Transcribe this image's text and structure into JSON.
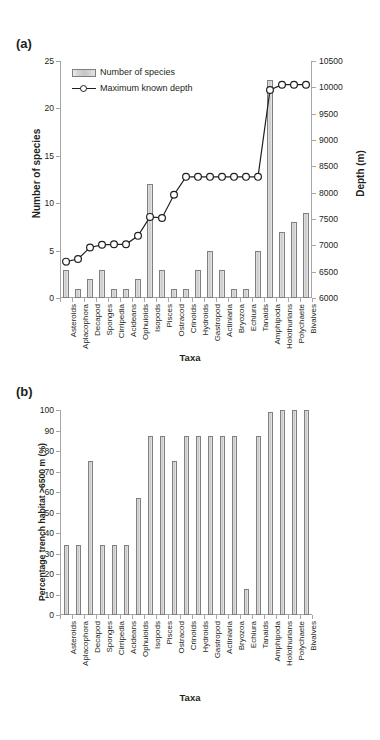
{
  "figure": {
    "panel_a_label": "(a)",
    "panel_b_label": "(b)"
  },
  "panel_a": {
    "legend": [
      {
        "key": "bars",
        "label": "Number of species",
        "icon": "bar-swatch"
      },
      {
        "key": "line",
        "label": "Maximum known depth",
        "icon": "line-marker"
      }
    ],
    "y_left_title": "Number of species",
    "y_right_title": "Depth (m)",
    "x_title": "Taxa"
  },
  "panel_b": {
    "y_title": "Percentage trench habitat >6500 m (%)",
    "x_title": "Taxa"
  },
  "chart_data": [
    {
      "type": "bar",
      "id": "panel-a",
      "title": "(a)",
      "xlabel": "Taxa",
      "ylabel": "Number of species",
      "y2label": "Depth (m)",
      "ylim": [
        0,
        25
      ],
      "yticks": [
        0,
        5,
        10,
        15,
        20,
        25
      ],
      "y2lim": [
        6000,
        10500
      ],
      "y2ticks": [
        6000,
        6500,
        7000,
        7500,
        8000,
        8500,
        9000,
        9500,
        10000,
        10500
      ],
      "grid": false,
      "legend": [
        "Number of species",
        "Maximum known depth"
      ],
      "legend_position": "upper left inside",
      "categories": [
        "Asteroids",
        "Aplacophora",
        "Decapod",
        "Sponges",
        "Cirripedia",
        "Acideans",
        "Ophuioids",
        "Isopods",
        "Pisces",
        "Ostracod",
        "Crinoids",
        "Hydroids",
        "Gastropod",
        "Actiniaria",
        "Bryozoa",
        "Echiura",
        "Tanaids",
        "Amphipoda",
        "Holothurians",
        "Polychaete",
        "Bivalves"
      ],
      "series": [
        {
          "name": "Number of species",
          "axis": "left",
          "type": "bar",
          "values": [
            3,
            1,
            2,
            3,
            1,
            1,
            2,
            12,
            3,
            1,
            1,
            3,
            5,
            3,
            1,
            1,
            5,
            23,
            7,
            8,
            9
          ]
        },
        {
          "name": "Maximum known depth",
          "axis": "right",
          "type": "line",
          "units": "m",
          "values": [
            6690,
            6740,
            6960,
            7010,
            7020,
            7020,
            7180,
            7540,
            7520,
            7960,
            8300,
            8300,
            8300,
            8300,
            8300,
            8300,
            8300,
            9950,
            10050,
            10050,
            10050
          ]
        }
      ]
    },
    {
      "type": "bar",
      "id": "panel-b",
      "title": "(b)",
      "xlabel": "Taxa",
      "ylabel": "Percentage trench habitat >6500 m (%)",
      "ylim": [
        0,
        100
      ],
      "yticks": [
        0,
        10,
        20,
        30,
        40,
        50,
        60,
        70,
        80,
        90,
        100
      ],
      "grid": false,
      "categories": [
        "Asteroids",
        "Aplacophora",
        "Decapod",
        "Sponges",
        "Cirripedia",
        "Acideans",
        "Ophuioids",
        "Isopods",
        "Pisces",
        "Ostracod",
        "Crinoids",
        "Hydroids",
        "Gastropod",
        "Actiniaria",
        "Bryozoa",
        "Echiura",
        "Tanaids",
        "Amphipoda",
        "Holothurians",
        "Polychaete",
        "Bivalves"
      ],
      "values": [
        34,
        34,
        75,
        34,
        34,
        34,
        57,
        87.5,
        87.5,
        75,
        87.5,
        87.5,
        87.5,
        87.5,
        87.5,
        12.5,
        87.5,
        99,
        100,
        100,
        100
      ]
    }
  ]
}
